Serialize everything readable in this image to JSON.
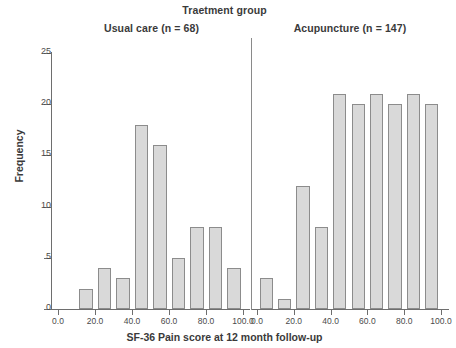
{
  "figure": {
    "super_title": "Traetment group",
    "x_axis_title": "SF-36 Pain score at 12 month follow-up",
    "y_axis_title": "Frequency"
  },
  "panels": [
    {
      "title": "Usual care (n = 68)"
    },
    {
      "title": "Acupuncture (n = 147)"
    }
  ],
  "axes": {
    "y_ticks": [
      "0",
      "5",
      "10",
      "15",
      "20",
      "25"
    ],
    "x_ticks": [
      "0.0",
      "20.0",
      "40.0",
      "60.0",
      "80.0",
      "100.0"
    ]
  },
  "chart_data": {
    "type": "bar",
    "title": "Traetment group",
    "xlabel": "SF-36 Pain score at 12 month follow-up",
    "ylabel": "Frequency",
    "ylim": [
      0,
      26
    ],
    "xlim": [
      0,
      100
    ],
    "grid": false,
    "legend": "none",
    "layout": "two side-by-side histogram panels sharing the y-axis",
    "panels": [
      {
        "name": "Usual care (n = 68)",
        "n": 68,
        "bin_width": 10,
        "bin_centers": [
          15,
          25,
          35,
          45,
          55,
          65,
          75,
          85,
          95
        ],
        "values": [
          2,
          4,
          3,
          18,
          16,
          5,
          8,
          8,
          4
        ],
        "x_ticks": [
          0.0,
          20.0,
          40.0,
          60.0,
          80.0,
          100.0
        ]
      },
      {
        "name": "Acupuncture (n = 147)",
        "n": 147,
        "bin_width": 10,
        "bin_centers": [
          5,
          15,
          25,
          35,
          45,
          55,
          65,
          75,
          85,
          95
        ],
        "values": [
          3,
          1,
          12,
          8,
          21,
          20,
          21,
          20,
          21,
          20
        ],
        "x_ticks": [
          0.0,
          20.0,
          40.0,
          60.0,
          80.0,
          100.0
        ]
      }
    ],
    "y_ticks": [
      0,
      5,
      10,
      15,
      20,
      25
    ],
    "bar_fill": "#d9d9d9",
    "bar_border": "#8c8c8c"
  }
}
